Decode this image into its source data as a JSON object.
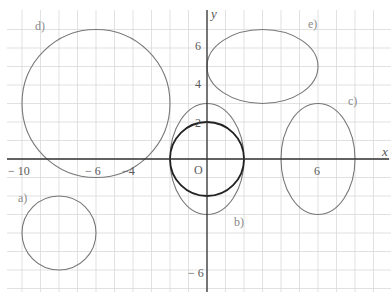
{
  "diagram": {
    "title": "",
    "colors": {
      "grid": "#d9d9d9",
      "axis": "#333333",
      "shape": "#777777",
      "shape_bold": "#222222"
    },
    "axes": {
      "x_label": "x",
      "y_label": "y",
      "origin_label": "O",
      "x_ticks": [
        {
          "value": -10,
          "label": "− 10"
        },
        {
          "value": -6,
          "label": "− 6"
        },
        {
          "value": -4,
          "label": "−4"
        },
        {
          "value": 6,
          "label": "6"
        }
      ],
      "y_ticks": [
        {
          "value": 6,
          "label": "6"
        },
        {
          "value": 4,
          "label": "4"
        },
        {
          "value": 2,
          "label": "2"
        },
        {
          "value": -6,
          "label": "− 6"
        }
      ],
      "x_range": [
        -10.8,
        9.9
      ],
      "y_range": [
        -7,
        8.1
      ]
    },
    "shapes": [
      {
        "id": "a",
        "label": "a)",
        "type": "circle",
        "cx": -8,
        "cy": -4,
        "rx": 2,
        "ry": 2,
        "bold": false
      },
      {
        "id": "b1",
        "label": "b)",
        "type": "circle",
        "cx": 0,
        "cy": 0,
        "rx": 2,
        "ry": 2,
        "bold": true
      },
      {
        "id": "b2",
        "label": "",
        "type": "ellipse",
        "cx": 0,
        "cy": 0,
        "rx": 2,
        "ry": 3,
        "bold": false
      },
      {
        "id": "c",
        "label": "c)",
        "type": "ellipse",
        "cx": 6,
        "cy": 0,
        "rx": 2,
        "ry": 3,
        "bold": false
      },
      {
        "id": "d",
        "label": "d)",
        "type": "circle",
        "cx": -6,
        "cy": 3,
        "rx": 4,
        "ry": 4,
        "bold": false
      },
      {
        "id": "e",
        "label": "e)",
        "type": "ellipse",
        "cx": 3,
        "cy": 5,
        "rx": 3,
        "ry": 2,
        "bold": false
      }
    ],
    "shape_labels": {
      "a": "a)",
      "b": "b)",
      "c": "c)",
      "d": "d)",
      "e": "e)"
    }
  }
}
